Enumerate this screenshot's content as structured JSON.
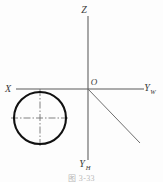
{
  "figure": {
    "type": "technical-drawing",
    "background_color": "#fdfdfd",
    "line_color": "#5a5a5a",
    "object_color": "#111111",
    "centerline_color": "#6b6b6b",
    "caption": "图 3-33"
  },
  "axes": [
    {
      "id": "z-axis",
      "label": "Z",
      "subscript": "",
      "label_x": 84,
      "label_y": 13,
      "x1": 88,
      "y1": 16,
      "x2": 88,
      "y2": 89
    },
    {
      "id": "x-axis",
      "label": "X",
      "subscript": "",
      "label_x": 8,
      "label_y": 92,
      "x1": 16,
      "y1": 89,
      "x2": 88,
      "y2": 89
    },
    {
      "id": "yw-axis",
      "label": "Y",
      "subscript": "W",
      "label_x": 145,
      "label_y": 92,
      "x1": 88,
      "y1": 89,
      "x2": 144,
      "y2": 89
    },
    {
      "id": "yh-axis",
      "label": "Y",
      "subscript": "H",
      "label_x": 79,
      "label_y": 167,
      "x1": 88,
      "y1": 89,
      "x2": 88,
      "y2": 160
    }
  ],
  "origin": {
    "label": "O",
    "label_x": 92,
    "label_y": 85,
    "x": 88,
    "y": 89
  },
  "bisector": {
    "id": "oy-bisector",
    "x1": 88,
    "y1": 89,
    "x2": 140,
    "y2": 143
  },
  "circle": {
    "id": "projection-circle",
    "cx": 40,
    "cy": 118,
    "r": 26,
    "stroke_width": 2.1
  },
  "centerlines": {
    "horizontal": {
      "x1": 11,
      "y1": 118,
      "x2": 69,
      "y2": 118
    },
    "vertical": {
      "x1": 40,
      "y1": 89,
      "x2": 40,
      "y2": 147
    }
  }
}
